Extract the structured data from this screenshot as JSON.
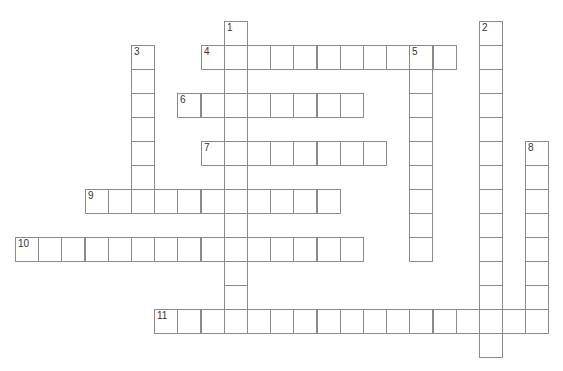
{
  "puzzle": {
    "grid": {
      "origin_x": 15,
      "origin_y": 20.7,
      "cell_w": 23.2,
      "cell_h": 24,
      "border_color": "#8a8a8a"
    },
    "entries": [
      {
        "number": "1",
        "direction": "down",
        "col": 9,
        "row": 0,
        "length": 13
      },
      {
        "number": "2",
        "direction": "down",
        "col": 20,
        "row": 0,
        "length": 14
      },
      {
        "number": "3",
        "direction": "down",
        "col": 5,
        "row": 1,
        "length": 7
      },
      {
        "number": "4",
        "direction": "across",
        "col": 8,
        "row": 1,
        "length": 11
      },
      {
        "number": "5",
        "direction": "down",
        "col": 17,
        "row": 1,
        "length": 9
      },
      {
        "number": "6",
        "direction": "across",
        "col": 7,
        "row": 3,
        "length": 8
      },
      {
        "number": "7",
        "direction": "across",
        "col": 8,
        "row": 5,
        "length": 8
      },
      {
        "number": "8",
        "direction": "down",
        "col": 22,
        "row": 5,
        "length": 8
      },
      {
        "number": "9",
        "direction": "across",
        "col": 3,
        "row": 7,
        "length": 11
      },
      {
        "number": "10",
        "direction": "across",
        "col": 0,
        "row": 9,
        "length": 15
      },
      {
        "number": "11",
        "direction": "across",
        "col": 6,
        "row": 12,
        "length": 17
      }
    ]
  }
}
